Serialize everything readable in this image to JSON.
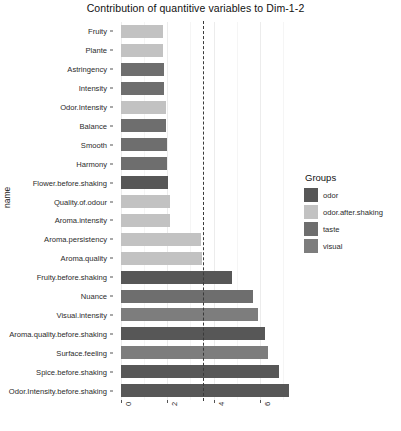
{
  "chart_data": {
    "type": "bar",
    "title": "Contribution of quantitive variables to Dim-1-2",
    "xlabel": "",
    "ylabel": "name",
    "orientation": "horizontal",
    "xlim": [
      0,
      7.6
    ],
    "ylim_categories": 20,
    "grid": true,
    "xticks": [
      0,
      2,
      4,
      6
    ],
    "xtick_labels": [
      "0",
      "2",
      "4",
      "6"
    ],
    "reference_line": {
      "value": 3.54,
      "style": "dashed",
      "color": "#3a3a3a",
      "label": "expected average contribution"
    },
    "legend": {
      "title": "Groups",
      "position": "right",
      "entries": [
        {
          "label": "odor",
          "color": "#575757"
        },
        {
          "label": "odor.after.shaking",
          "color": "#c2c2c2"
        },
        {
          "label": "taste",
          "color": "#6e6e6e"
        },
        {
          "label": "visual",
          "color": "#7d7d7d"
        }
      ]
    },
    "categories": [
      "Fruity",
      "Plante",
      "Astringency",
      "Intensity",
      "Odor.Intensity",
      "Balance",
      "Smooth",
      "Harmony",
      "Flower.before.shaking",
      "Quality.of.odour",
      "Aroma.intensity",
      "Aroma.persistency",
      "Aroma.quality",
      "Fruity.before.shaking",
      "Nuance",
      "Visual.intensity",
      "Aroma.quality.before.shaking",
      "Surface.feeling",
      "Spice.before.shaking",
      "Odor.Intensity.before.shaking"
    ],
    "values": [
      1.82,
      1.82,
      1.87,
      1.87,
      1.95,
      1.95,
      2.0,
      2.0,
      2.04,
      2.12,
      2.12,
      3.46,
      3.5,
      4.79,
      5.71,
      5.92,
      6.21,
      6.33,
      6.83,
      7.25
    ],
    "groups": [
      "odor.after.shaking",
      "odor.after.shaking",
      "taste",
      "taste",
      "odor.after.shaking",
      "taste",
      "taste",
      "taste",
      "odor",
      "odor.after.shaking",
      "odor.after.shaking",
      "odor.after.shaking",
      "odor.after.shaking",
      "odor",
      "taste",
      "visual",
      "odor",
      "visual",
      "odor",
      "odor"
    ]
  },
  "panel": {
    "gridlines_major": [
      0,
      2,
      4,
      6
    ],
    "gridlines_minor": [
      1,
      3,
      5,
      7
    ]
  }
}
